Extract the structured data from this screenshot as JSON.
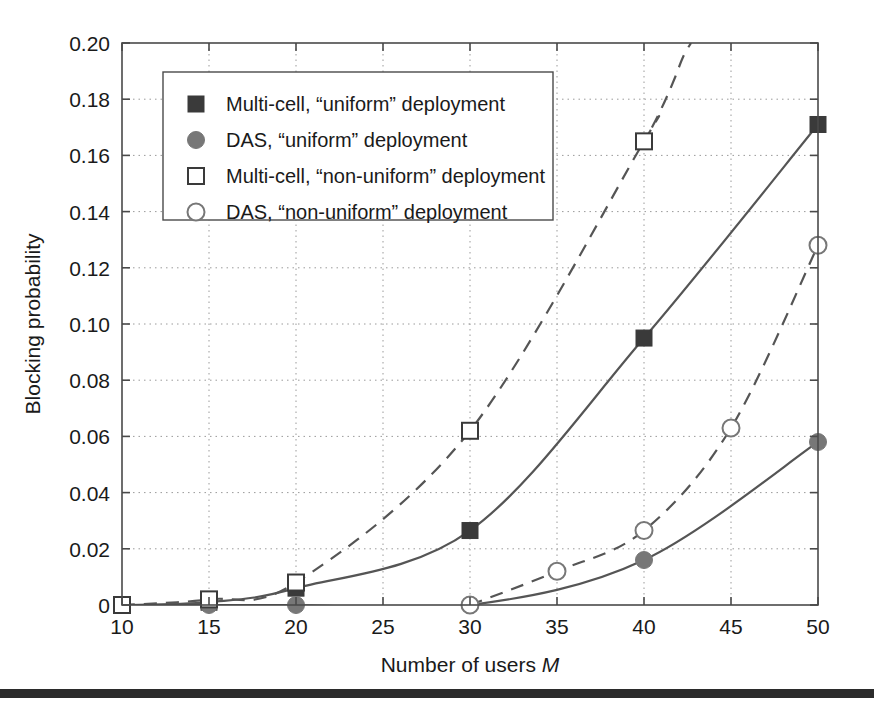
{
  "figure": {
    "background_color": "#ffffff",
    "axis_color": "#4a4a4a",
    "grid_color": "#9a9a9a",
    "series_color": "#555555",
    "marker_dark": "#3a3a3a",
    "marker_gray": "#777777",
    "bottom_rule_color": "#2b2b2b"
  },
  "chart_data": {
    "type": "line",
    "title": "",
    "xlabel": "Number of users M",
    "xlabel_plain": "Number of users",
    "xlabel_italic": "M",
    "ylabel": "Blocking probability",
    "xlim": [
      10,
      50
    ],
    "ylim": [
      0,
      0.2
    ],
    "xticks": [
      10,
      15,
      20,
      25,
      30,
      35,
      40,
      45,
      50
    ],
    "xtick_labels": [
      "10",
      "15",
      "20",
      "25",
      "30",
      "35",
      "40",
      "45",
      "50"
    ],
    "yticks": [
      0,
      0.02,
      0.04,
      0.06,
      0.08,
      0.1,
      0.12,
      0.14,
      0.16,
      0.18,
      0.2
    ],
    "ytick_labels": [
      "0",
      "0.02",
      "0.04",
      "0.06",
      "0.08",
      "0.10",
      "0.12",
      "0.14",
      "0.16",
      "0.18",
      "0.20"
    ],
    "grid": true,
    "grid_style": "dotted",
    "legend_position": "upper-left",
    "series": [
      {
        "name": "Multi-cell, “uniform” deployment",
        "marker": "filled-square",
        "line": "solid",
        "x": [
          10,
          15,
          20,
          30,
          40,
          50
        ],
        "values": [
          0.0,
          0.001,
          0.006,
          0.0265,
          0.095,
          0.171
        ]
      },
      {
        "name": "DAS, “uniform” deployment",
        "marker": "filled-circle",
        "line": "solid",
        "x": [
          10,
          15,
          20,
          30,
          40,
          50
        ],
        "values": [
          0.0,
          0.0,
          0.0,
          0.0,
          0.016,
          0.058
        ]
      },
      {
        "name": "Multi-cell, “non-uniform” deployment",
        "marker": "open-square",
        "line": "dashed",
        "x": [
          10,
          15,
          20,
          30,
          40
        ],
        "values": [
          0.0,
          0.002,
          0.008,
          0.062,
          0.165
        ]
      },
      {
        "name": "DAS, “non-uniform” deployment",
        "marker": "open-circle",
        "line": "dashed",
        "x": [
          30,
          35,
          40,
          45,
          50
        ],
        "values": [
          0.0,
          0.012,
          0.0265,
          0.063,
          0.128
        ]
      }
    ]
  },
  "legend": {
    "items": [
      {
        "label": "Multi-cell, “uniform” deployment",
        "marker": "filled-square"
      },
      {
        "label": "DAS, “uniform” deployment",
        "marker": "filled-circle"
      },
      {
        "label": "Multi-cell, “non-uniform” deployment",
        "marker": "open-square"
      },
      {
        "label": "DAS, “non-uniform” deployment",
        "marker": "open-circle"
      }
    ]
  }
}
